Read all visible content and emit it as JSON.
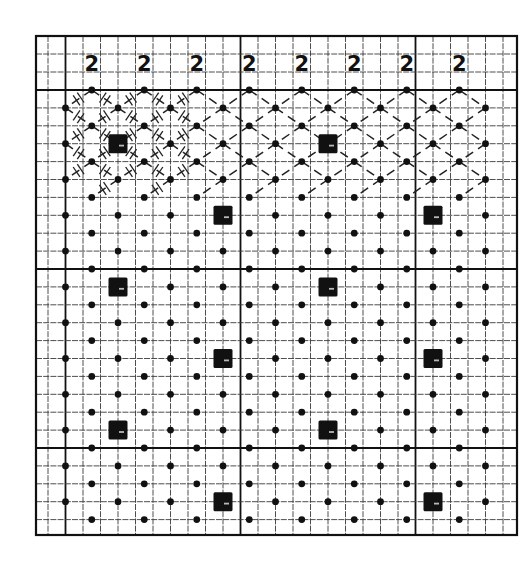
{
  "diagram": {
    "type": "pattern-chart",
    "header": {
      "labels": [
        "2",
        "2",
        "2",
        "2",
        "2",
        "2",
        "2",
        "2"
      ]
    },
    "grid": {
      "border": {
        "left": 36,
        "top": 36,
        "right": 517,
        "bottom": 535
      },
      "header_rows_y": [
        36,
        54,
        72,
        90
      ],
      "col_origin_x": 48,
      "cell_width": 17.5,
      "col_line_count": 27,
      "thick_col_indices": [
        1,
        11,
        21
      ],
      "row_origin_y": 90,
      "cell_height": 17.9,
      "row_line_count": 25,
      "thick_row_indices": [
        0,
        10,
        20
      ]
    },
    "lattice": {
      "even_row_col_offsets": [
        2.5,
        5.5,
        8.5,
        11.5,
        14.5,
        17.5,
        20.5,
        23.5
      ],
      "odd_row_col_offsets": [
        1,
        4,
        7,
        10,
        13,
        16,
        19,
        22,
        25
      ],
      "rows": 25
    },
    "squares": [
      {
        "row": 3,
        "col": 4
      },
      {
        "row": 3,
        "col": 16
      },
      {
        "row": 7,
        "col": 10
      },
      {
        "row": 7,
        "col": 22
      },
      {
        "row": 11,
        "col": 4
      },
      {
        "row": 11,
        "col": 16
      },
      {
        "row": 15,
        "col": 10
      },
      {
        "row": 15,
        "col": 22
      },
      {
        "row": 19,
        "col": 4
      },
      {
        "row": 19,
        "col": 16
      },
      {
        "row": 23,
        "col": 10
      },
      {
        "row": 23,
        "col": 22
      }
    ],
    "diagonal_band": {
      "first_row": 0,
      "last_row": 5,
      "hatched_max_col": 9
    },
    "colors": {
      "ink": "#111111",
      "paper": "#ffffff",
      "grid": "#3a3a3a"
    }
  }
}
